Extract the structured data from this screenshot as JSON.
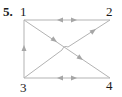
{
  "problem": {
    "number": "5."
  },
  "colors": {
    "edge": "#b3b3b3",
    "arrow": "#a6a6a6",
    "label": "#1a1a1a"
  },
  "nodes": [
    {
      "id": "1",
      "label": "1",
      "x": 24,
      "y": 20
    },
    {
      "id": "2",
      "label": "2",
      "x": 110,
      "y": 20
    },
    {
      "id": "3",
      "label": "3",
      "x": 24,
      "y": 78
    },
    {
      "id": "4",
      "label": "4",
      "x": 110,
      "y": 78
    }
  ],
  "edges": [
    {
      "from": "1",
      "to": "2",
      "directed": "both"
    },
    {
      "from": "3",
      "to": "4",
      "directed": "both"
    },
    {
      "from": "3",
      "to": "1",
      "directed": "forward"
    },
    {
      "from": "1",
      "to": "4",
      "directed": "forward"
    },
    {
      "from": "3",
      "to": "2",
      "directed": "forward",
      "crossing_hop": true
    }
  ]
}
